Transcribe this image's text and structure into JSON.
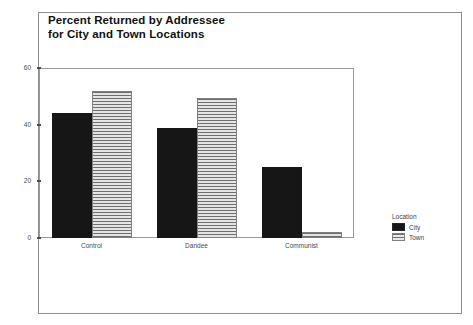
{
  "chart_data": {
    "type": "bar",
    "title_line1": "Percent Returned by Addressee",
    "title_line2": "for City and Town Locations",
    "xlabel": "",
    "ylabel": "",
    "ylim": [
      0,
      60
    ],
    "yticks": [
      0,
      20,
      40,
      60
    ],
    "ytick_labels": [
      "0",
      "20",
      "40",
      "60"
    ],
    "grid": false,
    "categories": [
      "Control",
      "Dandee",
      "Communist"
    ],
    "legend_title": "Location",
    "legend_position": "right",
    "series": [
      {
        "name": "City",
        "color": "#161616",
        "pattern": "solid",
        "values": [
          44,
          39,
          25
        ]
      },
      {
        "name": "Town",
        "color": "#e4e4e4",
        "pattern": "horizontal-stripes",
        "values": [
          52,
          49.5,
          2
        ]
      }
    ]
  },
  "figure": {
    "background": "#ffffff",
    "frame_color": "#8d8d8d",
    "axis_color": "#9a9a9a",
    "text_color": "#3f3f3f"
  }
}
